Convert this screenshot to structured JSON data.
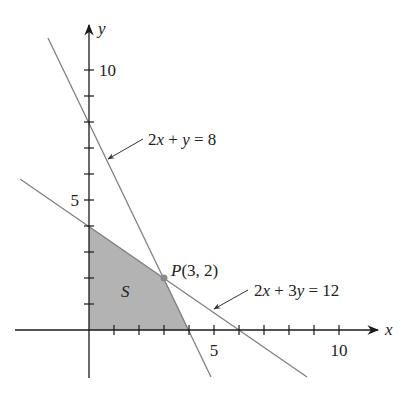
{
  "figure": {
    "type": "linear-programming-feasible-region",
    "axes": {
      "x_label": "x",
      "y_label": "y",
      "x_ticks": [
        1,
        2,
        3,
        4,
        5,
        6,
        7,
        8,
        9,
        10
      ],
      "y_ticks": [
        1,
        2,
        3,
        4,
        5,
        6,
        7,
        8,
        9,
        10
      ],
      "x_tick_labels": [
        {
          "value": 5,
          "text": "5"
        },
        {
          "value": 10,
          "text": "10"
        }
      ],
      "y_tick_labels": [
        {
          "value": 5,
          "text": "5"
        },
        {
          "value": 10,
          "text": "10"
        }
      ]
    },
    "lines": [
      {
        "equation": "2x + y = 8",
        "label_parts": [
          "2",
          "x",
          " + ",
          "y",
          " = 8"
        ]
      },
      {
        "equation": "2x + 3y = 12",
        "label_parts": [
          "2",
          "x",
          " + 3",
          "y",
          " = 12"
        ]
      }
    ],
    "point": {
      "name": "P",
      "x": 3,
      "y": 2,
      "label_tail": "(3, 2)"
    },
    "region": {
      "name": "S",
      "vertices": [
        [
          0,
          0
        ],
        [
          4,
          0
        ],
        [
          3,
          2
        ],
        [
          0,
          4
        ]
      ],
      "fill": "#b3b3b3"
    },
    "colors": {
      "axis": "#1a1a1a",
      "line": "#808080",
      "region": "#b3b3b3",
      "point": "#8a8a8a",
      "text": "#222222"
    }
  }
}
